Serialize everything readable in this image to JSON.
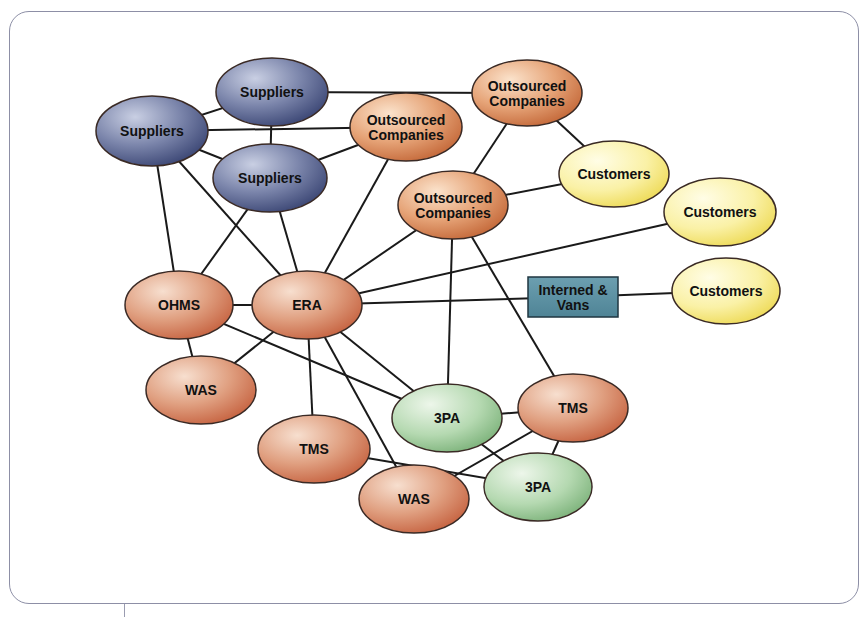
{
  "diagram": {
    "type": "network",
    "colors": {
      "supplier": "#5d6891",
      "outsourced": "#d9926a",
      "customer": "#f6ec8c",
      "internal": "#d4886a",
      "third_party": "#9fcb9f",
      "box": "#5b8fa0",
      "edge": "#1a1a1a",
      "frame": "#8d8fa6"
    },
    "nodes": [
      {
        "id": "sup_left",
        "label": [
          "Suppliers"
        ],
        "shape": "ellipse",
        "kind": "supplier",
        "cx": 152,
        "cy": 131,
        "rx": 56,
        "ry": 35
      },
      {
        "id": "sup_top",
        "label": [
          "Suppliers"
        ],
        "shape": "ellipse",
        "kind": "supplier",
        "cx": 272,
        "cy": 92,
        "rx": 56,
        "ry": 34
      },
      {
        "id": "sup_mid",
        "label": [
          "Suppliers"
        ],
        "shape": "ellipse",
        "kind": "supplier",
        "cx": 270,
        "cy": 178,
        "rx": 57,
        "ry": 34
      },
      {
        "id": "out_mid",
        "label": [
          "Outsourced",
          "Companies"
        ],
        "shape": "ellipse",
        "kind": "outsourced",
        "cx": 406,
        "cy": 127,
        "rx": 56,
        "ry": 34
      },
      {
        "id": "out_top",
        "label": [
          "Outsourced",
          "Companies"
        ],
        "shape": "ellipse",
        "kind": "outsourced",
        "cx": 527,
        "cy": 93,
        "rx": 55,
        "ry": 33
      },
      {
        "id": "out_low",
        "label": [
          "Outsourced",
          "Companies"
        ],
        "shape": "ellipse",
        "kind": "outsourced",
        "cx": 453,
        "cy": 205,
        "rx": 55,
        "ry": 34
      },
      {
        "id": "cust_1",
        "label": [
          "Customers"
        ],
        "shape": "ellipse",
        "kind": "customer",
        "cx": 614,
        "cy": 174,
        "rx": 55,
        "ry": 33
      },
      {
        "id": "cust_2",
        "label": [
          "Customers"
        ],
        "shape": "ellipse",
        "kind": "customer",
        "cx": 720,
        "cy": 212,
        "rx": 56,
        "ry": 34
      },
      {
        "id": "cust_3",
        "label": [
          "Customers"
        ],
        "shape": "ellipse",
        "kind": "customer",
        "cx": 726,
        "cy": 291,
        "rx": 54,
        "ry": 33
      },
      {
        "id": "interned",
        "label": [
          "Interned &",
          "Vans"
        ],
        "shape": "rect",
        "kind": "box",
        "x": 528,
        "y": 277,
        "w": 90,
        "h": 40
      },
      {
        "id": "ohms",
        "label": [
          "OHMS"
        ],
        "shape": "ellipse",
        "kind": "internal",
        "cx": 179,
        "cy": 305,
        "rx": 54,
        "ry": 34
      },
      {
        "id": "era",
        "label": [
          "ERA"
        ],
        "shape": "ellipse",
        "kind": "internal",
        "cx": 307,
        "cy": 305,
        "rx": 55,
        "ry": 34
      },
      {
        "id": "was_left",
        "label": [
          "WAS"
        ],
        "shape": "ellipse",
        "kind": "internal",
        "cx": 201,
        "cy": 390,
        "rx": 55,
        "ry": 34
      },
      {
        "id": "tms_left",
        "label": [
          "TMS"
        ],
        "shape": "ellipse",
        "kind": "internal",
        "cx": 314,
        "cy": 449,
        "rx": 56,
        "ry": 34
      },
      {
        "id": "tpa_up",
        "label": [
          "3PA"
        ],
        "shape": "ellipse",
        "kind": "third_party",
        "cx": 447,
        "cy": 418,
        "rx": 55,
        "ry": 34
      },
      {
        "id": "tms_right",
        "label": [
          "TMS"
        ],
        "shape": "ellipse",
        "kind": "internal",
        "cx": 573,
        "cy": 408,
        "rx": 55,
        "ry": 34
      },
      {
        "id": "tpa_low",
        "label": [
          "3PA"
        ],
        "shape": "ellipse",
        "kind": "third_party",
        "cx": 538,
        "cy": 487,
        "rx": 54,
        "ry": 34
      },
      {
        "id": "was_low",
        "label": [
          "WAS"
        ],
        "shape": "ellipse",
        "kind": "internal",
        "cx": 414,
        "cy": 499,
        "rx": 55,
        "ry": 34
      }
    ],
    "edges": [
      [
        "sup_left",
        "sup_top"
      ],
      [
        "sup_left",
        "sup_mid"
      ],
      [
        "sup_left",
        "out_mid"
      ],
      [
        "sup_left",
        "ohms"
      ],
      [
        "sup_left",
        "era"
      ],
      [
        "sup_top",
        "sup_mid"
      ],
      [
        "sup_top",
        "out_top"
      ],
      [
        "sup_mid",
        "out_mid"
      ],
      [
        "sup_mid",
        "ohms"
      ],
      [
        "sup_mid",
        "era"
      ],
      [
        "out_mid",
        "era"
      ],
      [
        "out_top",
        "out_low"
      ],
      [
        "out_top",
        "cust_1"
      ],
      [
        "out_low",
        "cust_1"
      ],
      [
        "out_low",
        "era"
      ],
      [
        "out_low",
        "tpa_up"
      ],
      [
        "out_low",
        "tms_right"
      ],
      [
        "era",
        "cust_2"
      ],
      [
        "era",
        "interned"
      ],
      [
        "interned",
        "cust_3"
      ],
      [
        "ohms",
        "era"
      ],
      [
        "ohms",
        "was_left"
      ],
      [
        "ohms",
        "tpa_up"
      ],
      [
        "era",
        "was_left"
      ],
      [
        "era",
        "tms_left"
      ],
      [
        "era",
        "was_low"
      ],
      [
        "era",
        "tpa_up"
      ],
      [
        "tpa_up",
        "tms_right"
      ],
      [
        "tpa_up",
        "tpa_low"
      ],
      [
        "tms_right",
        "was_low"
      ],
      [
        "tms_right",
        "tpa_low"
      ],
      [
        "tms_left",
        "tpa_low"
      ]
    ]
  }
}
